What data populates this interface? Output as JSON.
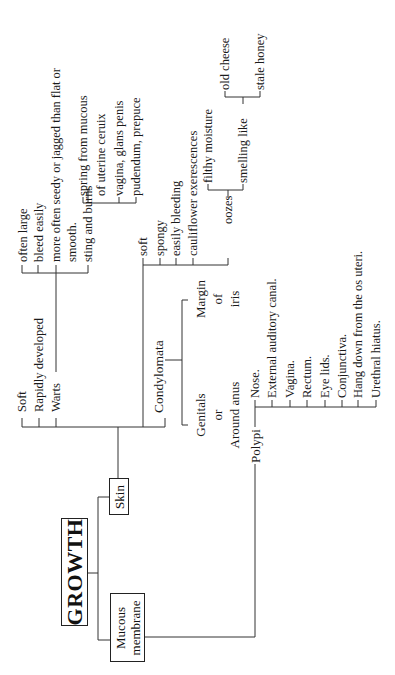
{
  "root": {
    "label": "GROWTH"
  },
  "branches": {
    "skin": {
      "label": "Skin",
      "items": [
        "Soft",
        "Rapidly developed",
        "Warts",
        "Condylomata"
      ],
      "warts": {
        "items": [
          "often large",
          "bleed easily",
          "more often seedy or jagged than flat or",
          "smooth.",
          "sting and burns"
        ],
        "sting_and_burns": {
          "items": [
            "spring from mucous",
            "of uterine ceruix",
            "vagina, glans penis",
            "pudendum, prepuce"
          ]
        }
      },
      "condylomata": {
        "location": {
          "genitals": [
            "Genitals",
            "or",
            "Around anus"
          ],
          "iris": [
            "Margin",
            "of",
            "iris"
          ]
        },
        "items": [
          "soft",
          "spongy",
          "easily bleeding",
          "cauliflower exerescences",
          "oozes"
        ],
        "oozes": {
          "items": [
            "filthy moisture",
            "smelling like"
          ],
          "smelling_like": {
            "items": [
              "old cheese",
              "stale honey"
            ]
          }
        }
      }
    },
    "mucous_membrane": {
      "label_line1": "Mucous",
      "label_line2": "membrane",
      "polypi": {
        "label": "Polypi",
        "items": [
          "Nose.",
          "External auditory canal.",
          "Vagina.",
          "Rectum.",
          "Eye lids.",
          "Conjunctiva.",
          "Hang down from the os uteri.",
          "Urethral hiatus."
        ]
      }
    }
  }
}
